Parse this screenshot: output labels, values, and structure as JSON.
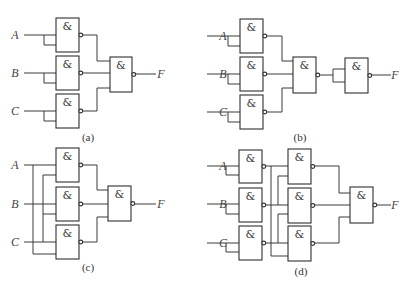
{
  "diagrams": [
    {
      "id": "a",
      "caption": "(a)",
      "caption_pos": [
        88,
        141
      ],
      "inputs": [
        {
          "label": "A",
          "x": 15,
          "y": 35
        },
        {
          "label": "B",
          "x": 15,
          "y": 73
        },
        {
          "label": "C",
          "x": 15,
          "y": 111
        }
      ],
      "output": {
        "label": "F",
        "x": 158,
        "y": 78
      },
      "gates": [
        {
          "x": 56,
          "y": 18,
          "w": 23,
          "h": 34
        },
        {
          "x": 56,
          "y": 56,
          "w": 23,
          "h": 34
        },
        {
          "x": 56,
          "y": 94,
          "w": 23,
          "h": 34
        },
        {
          "x": 110,
          "y": 57,
          "w": 22,
          "h": 35
        }
      ],
      "wires": [
        "M24 35 H56",
        "M44 35 V45 H56",
        "M24 73 H56",
        "M44 73 V83 H56",
        "M24 111 H56",
        "M44 111 V121 H56",
        "M82 35 H97 V61 H110",
        "M82 73 H110",
        "M82 111 H97 V88 H110",
        "M135 74 H156"
      ]
    },
    {
      "id": "b",
      "caption": "(b)",
      "caption_pos": [
        300,
        141
      ],
      "inputs": [
        {
          "label": "A",
          "x": 223,
          "y": 36
        },
        {
          "label": "B",
          "x": 223,
          "y": 74
        },
        {
          "label": "C",
          "x": 223,
          "y": 112
        }
      ],
      "output": {
        "label": "F",
        "x": 392,
        "y": 79
      },
      "gates": [
        {
          "x": 240,
          "y": 19,
          "w": 23,
          "h": 34
        },
        {
          "x": 240,
          "y": 57,
          "w": 23,
          "h": 34
        },
        {
          "x": 240,
          "y": 95,
          "w": 23,
          "h": 34
        },
        {
          "x": 293,
          "y": 57,
          "w": 23,
          "h": 36
        },
        {
          "x": 345,
          "y": 58,
          "w": 23,
          "h": 35
        }
      ],
      "wires": [
        "M207 36 H240",
        "M228 36 V46 H240",
        "M207 74 H240",
        "M228 74 V84 H240",
        "M207 112 H240",
        "M228 112 V122 H240",
        "M266 36 H282 V61 H293",
        "M266 74 H293",
        "M266 112 H282 V88 H293",
        "M319 75 H333 V69 H345",
        "M333 75 V82 H345",
        "M371 75 H391"
      ]
    },
    {
      "id": "c",
      "caption": "(c)",
      "caption_pos": [
        88,
        271
      ],
      "inputs": [
        {
          "label": "A",
          "x": 15,
          "y": 165
        },
        {
          "label": "B",
          "x": 15,
          "y": 204
        },
        {
          "label": "C",
          "x": 15,
          "y": 242
        }
      ],
      "output": {
        "label": "F",
        "x": 158,
        "y": 208
      },
      "gates": [
        {
          "x": 56,
          "y": 148,
          "w": 23,
          "h": 34
        },
        {
          "x": 56,
          "y": 187,
          "w": 23,
          "h": 34
        },
        {
          "x": 56,
          "y": 225,
          "w": 23,
          "h": 34
        },
        {
          "x": 108,
          "y": 186,
          "w": 23,
          "h": 35
        }
      ],
      "wires": [
        "M24 165 H56",
        "M24 204 H56",
        "M24 242 H56",
        "M33 165 V254 H56",
        "M43 204 V175 H56",
        "M43 204 V214",
        "M43 242 V214 H56",
        "M43 204",
        "M82 165 H97 V190 H108",
        "M82 204 H108",
        "M82 242 H97 V217 H108",
        "M134 204 H156"
      ]
    },
    {
      "id": "d",
      "caption": "(d)",
      "caption_pos": [
        301,
        275
      ],
      "inputs": [
        {
          "label": "A",
          "x": 223,
          "y": 166
        },
        {
          "label": "B",
          "x": 223,
          "y": 204
        },
        {
          "label": "C",
          "x": 223,
          "y": 243
        }
      ],
      "output": {
        "label": "F",
        "x": 392,
        "y": 209
      },
      "gates": [
        {
          "x": 239,
          "y": 150,
          "w": 23,
          "h": 33
        },
        {
          "x": 239,
          "y": 188,
          "w": 23,
          "h": 34
        },
        {
          "x": 239,
          "y": 226,
          "w": 23,
          "h": 34
        },
        {
          "x": 288,
          "y": 149,
          "w": 23,
          "h": 35
        },
        {
          "x": 288,
          "y": 188,
          "w": 23,
          "h": 35
        },
        {
          "x": 288,
          "y": 226,
          "w": 23,
          "h": 35
        },
        {
          "x": 350,
          "y": 187,
          "w": 23,
          "h": 36
        }
      ],
      "wires": [
        "M207 166 H239",
        "M226 166 V175 H239",
        "M207 204 H239",
        "M226 204 V214 H239",
        "M207 243 H239",
        "M226 243 V252 H239",
        "M265 166 H288",
        "M265 205 H288",
        "M265 243 H288",
        "M271 166 V256 H288",
        "M278 205 V176 H288",
        "M278 243 V214 H288",
        "M314 166 H339 V193 H350",
        "M314 205 H350",
        "M314 243 H339 V217 H350",
        "M376 205 H391"
      ]
    }
  ],
  "gate_symbol": "&",
  "colors": {
    "line": "#3a3a3a",
    "background": "#ffffff"
  }
}
